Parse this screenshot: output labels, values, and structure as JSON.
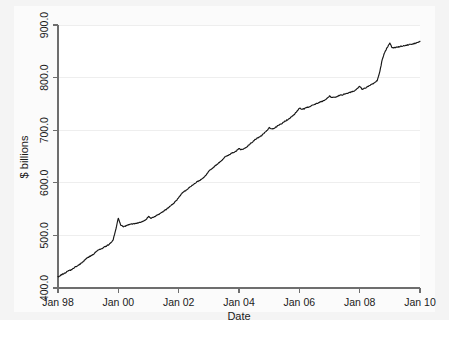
{
  "chart_data": {
    "type": "line",
    "title": "",
    "subtitle": "",
    "xlabel": "Date",
    "ylabel": "$ billions",
    "grid": true,
    "grid_axis": "y",
    "legend": false,
    "legend_position": "none",
    "xlim": [
      "Jan 98",
      "Jan 10"
    ],
    "ylim": [
      400.0,
      900.0
    ],
    "xtick_labels": [
      "Jan 98",
      "Jan 00",
      "Jan 02",
      "Jan 04",
      "Jan 06",
      "Jan 08",
      "Jan 10"
    ],
    "xtick_values": [
      1998.0,
      2000.0,
      2002.0,
      2004.0,
      2006.0,
      2008.0,
      2010.0
    ],
    "ytick_labels": [
      "400.0",
      "500.0",
      "600.0",
      "700.0",
      "800.0",
      "900.0"
    ],
    "ytick_values": [
      400.0,
      500.0,
      600.0,
      700.0,
      800.0,
      900.0
    ],
    "series": [
      {
        "name": "Currency in circulation",
        "color": "#161616",
        "x": [
          1998.0,
          1998.08,
          1998.17,
          1998.25,
          1998.33,
          1998.42,
          1998.5,
          1998.58,
          1998.67,
          1998.75,
          1998.83,
          1998.92,
          1999.0,
          1999.08,
          1999.17,
          1999.25,
          1999.33,
          1999.42,
          1999.5,
          1999.58,
          1999.67,
          1999.75,
          1999.83,
          1999.92,
          2000.0,
          2000.08,
          2000.17,
          2000.25,
          2000.33,
          2000.42,
          2000.5,
          2000.58,
          2000.67,
          2000.75,
          2000.83,
          2000.92,
          2001.0,
          2001.08,
          2001.17,
          2001.25,
          2001.33,
          2001.42,
          2001.5,
          2001.58,
          2001.67,
          2001.75,
          2001.83,
          2001.92,
          2002.0,
          2002.08,
          2002.17,
          2002.25,
          2002.33,
          2002.42,
          2002.5,
          2002.58,
          2002.67,
          2002.75,
          2002.83,
          2002.92,
          2003.0,
          2003.08,
          2003.17,
          2003.25,
          2003.33,
          2003.42,
          2003.5,
          2003.58,
          2003.67,
          2003.75,
          2003.83,
          2003.92,
          2004.0,
          2004.08,
          2004.17,
          2004.25,
          2004.33,
          2004.42,
          2004.5,
          2004.58,
          2004.67,
          2004.75,
          2004.83,
          2004.92,
          2005.0,
          2005.08,
          2005.17,
          2005.25,
          2005.33,
          2005.42,
          2005.5,
          2005.58,
          2005.67,
          2005.75,
          2005.83,
          2005.92,
          2006.0,
          2006.08,
          2006.17,
          2006.25,
          2006.33,
          2006.42,
          2006.5,
          2006.58,
          2006.67,
          2006.75,
          2006.83,
          2006.92,
          2007.0,
          2007.08,
          2007.17,
          2007.25,
          2007.33,
          2007.42,
          2007.5,
          2007.58,
          2007.67,
          2007.75,
          2007.83,
          2007.92,
          2008.0,
          2008.08,
          2008.17,
          2008.25,
          2008.33,
          2008.42,
          2008.5,
          2008.58,
          2008.67,
          2008.75,
          2008.83,
          2008.92,
          2009.0,
          2009.08,
          2009.17,
          2009.25,
          2009.33,
          2009.42,
          2009.5,
          2009.58,
          2009.67,
          2009.75,
          2009.83,
          2009.92,
          2010.0
        ],
        "y": [
          421,
          424,
          427,
          429,
          432,
          434,
          437,
          440,
          443,
          446,
          450,
          455,
          458,
          461,
          464,
          468,
          472,
          474,
          477,
          479,
          482,
          486,
          492,
          512,
          533,
          519,
          517,
          518,
          520,
          521,
          522,
          523,
          524,
          525,
          527,
          530,
          536,
          533,
          535,
          537,
          540,
          543,
          546,
          549,
          553,
          557,
          561,
          566,
          572,
          578,
          583,
          586,
          590,
          594,
          597,
          601,
          604,
          606,
          610,
          616,
          622,
          626,
          630,
          634,
          638,
          642,
          647,
          651,
          653,
          656,
          658,
          661,
          665,
          663,
          665,
          668,
          672,
          676,
          680,
          684,
          687,
          690,
          694,
          699,
          705,
          702,
          704,
          707,
          710,
          713,
          716,
          719,
          722,
          726,
          730,
          736,
          742,
          740,
          741,
          743,
          745,
          747,
          749,
          751,
          753,
          755,
          757,
          761,
          765,
          762,
          763,
          764,
          766,
          767,
          769,
          770,
          772,
          773,
          775,
          779,
          784,
          778,
          780,
          782,
          785,
          788,
          791,
          794,
          812,
          835,
          848,
          858,
          866,
          856,
          857,
          858,
          859,
          860,
          861,
          862,
          863,
          864,
          865,
          867,
          869
        ]
      }
    ]
  },
  "axes": {
    "y_title": "$ billions",
    "x_title": "Date",
    "y_ticks": [
      "900.0",
      "800.0",
      "700.0",
      "600.0",
      "500.0",
      "400.0"
    ],
    "x_ticks": [
      "Jan 98",
      "Jan 00",
      "Jan 02",
      "Jan 04",
      "Jan 06",
      "Jan 08",
      "Jan 10"
    ]
  },
  "colors": {
    "line": "#161616",
    "axis": "#6e6e6e",
    "grid": "#eeeeee",
    "plot_background": "#ffffff",
    "page_background": "#f4f4f4"
  }
}
